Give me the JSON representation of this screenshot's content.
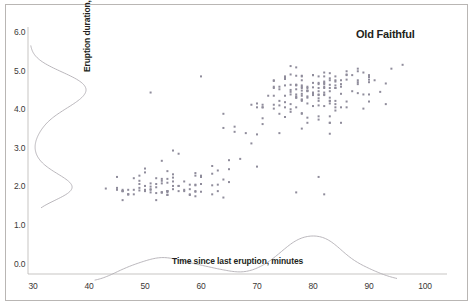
{
  "chart_data": {
    "type": "scatter",
    "title": "Old Faithful",
    "xlabel": "Time since last eruption, minutes",
    "ylabel": "Eruption duration, minutes",
    "xlim": [
      30,
      100
    ],
    "ylim": [
      0.0,
      6.0
    ],
    "xticks": [
      "30",
      "40",
      "50",
      "60",
      "70",
      "80",
      "90",
      "100"
    ],
    "xtick_values": [
      30,
      40,
      50,
      60,
      70,
      80,
      90,
      100
    ],
    "yticks": [
      "0.0",
      "1.0",
      "2.0",
      "3.0",
      "4.0",
      "5.0",
      "6.0"
    ],
    "ytick_values": [
      0,
      1,
      2,
      3,
      4,
      5,
      6
    ],
    "grid": false,
    "legend": null,
    "marker": {
      "shape": "square",
      "size_px": 2,
      "color": "#8f8c9b"
    },
    "axis_color": "#b9b6b4",
    "text_color": "#231f20",
    "background": "#ffffff",
    "x": [
      79,
      54,
      74,
      62,
      85,
      55,
      88,
      85,
      51,
      85,
      54,
      84,
      78,
      47,
      83,
      52,
      62,
      84,
      52,
      79,
      51,
      47,
      78,
      69,
      74,
      83,
      55,
      76,
      78,
      79,
      73,
      77,
      66,
      80,
      74,
      52,
      48,
      80,
      59,
      90,
      80,
      58,
      84,
      58,
      73,
      83,
      64,
      53,
      82,
      59,
      75,
      90,
      54,
      80,
      54,
      83,
      71,
      64,
      77,
      81,
      59,
      84,
      48,
      82,
      60,
      92,
      78,
      78,
      65,
      73,
      82,
      56,
      79,
      71,
      62,
      76,
      60,
      78,
      76,
      83,
      75,
      82,
      70,
      65,
      73,
      88,
      76,
      80,
      48,
      86,
      60,
      90,
      50,
      78,
      63,
      72,
      84,
      75,
      51,
      82,
      62,
      88,
      49,
      83,
      81,
      47,
      84,
      52,
      86,
      81,
      75,
      59,
      89,
      79,
      59,
      81,
      50,
      85,
      59,
      87,
      53,
      69,
      77,
      56,
      88,
      81,
      45,
      82,
      55,
      90,
      45,
      83,
      56,
      89,
      46,
      82,
      51,
      86,
      53,
      79,
      81,
      60,
      82,
      77,
      76,
      59,
      80,
      49,
      96,
      53,
      77,
      77,
      65,
      81,
      71,
      70,
      81,
      93,
      53,
      89,
      45,
      86,
      58,
      78,
      66,
      76,
      63,
      88,
      52,
      93,
      49,
      57,
      77,
      68,
      81,
      81,
      73,
      50,
      85,
      74,
      55,
      77,
      83,
      83,
      51,
      78,
      84,
      46,
      83,
      55,
      81,
      57,
      76,
      84,
      77,
      81,
      87,
      77,
      51,
      78,
      60,
      82,
      91,
      53,
      78,
      46,
      77,
      84,
      49,
      83,
      71,
      80,
      49,
      75,
      64,
      76,
      53,
      94,
      55,
      76,
      50,
      82,
      54,
      75,
      78,
      79,
      78,
      78,
      70,
      79,
      70,
      54,
      86,
      50,
      90,
      54,
      54,
      77,
      79,
      64,
      75,
      47,
      86,
      63,
      85,
      82,
      57,
      82,
      67,
      74,
      54,
      83,
      73,
      73,
      88,
      80,
      71,
      83,
      56,
      79,
      78,
      84,
      58,
      83,
      43,
      60,
      75,
      81,
      46,
      90,
      46,
      74
    ],
    "y": [
      3.6,
      1.8,
      3.333,
      2.283,
      4.533,
      2.883,
      4.7,
      3.6,
      1.95,
      4.35,
      1.833,
      3.917,
      4.2,
      1.75,
      4.7,
      2.167,
      1.75,
      4.8,
      1.6,
      4.25,
      1.8,
      1.75,
      3.45,
      3.067,
      4.533,
      3.6,
      1.967,
      4.083,
      3.85,
      4.433,
      4.3,
      4.467,
      3.367,
      4.033,
      3.833,
      2.017,
      1.867,
      4.833,
      1.833,
      4.783,
      4.35,
      1.883,
      4.567,
      1.75,
      4.533,
      3.317,
      3.833,
      2.1,
      4.633,
      2.0,
      4.8,
      4.716,
      1.833,
      4.833,
      1.733,
      4.883,
      3.717,
      1.667,
      4.567,
      4.317,
      2.233,
      4.5,
      1.75,
      4.8,
      1.817,
      4.4,
      4.167,
      4.7,
      2.067,
      4.7,
      4.033,
      1.967,
      4.5,
      4.0,
      1.983,
      5.067,
      2.017,
      4.567,
      3.883,
      3.6,
      4.133,
      4.333,
      4.1,
      2.633,
      4.067,
      4.933,
      3.95,
      4.517,
      2.167,
      4.0,
      2.2,
      4.333,
      1.867,
      4.817,
      1.833,
      4.3,
      4.667,
      3.75,
      1.867,
      4.9,
      2.483,
      4.367,
      2.1,
      4.5,
      4.05,
      1.867,
      4.7,
      1.783,
      4.85,
      3.683,
      4.733,
      2.3,
      4.9,
      4.417,
      1.7,
      4.633,
      2.317,
      4.6,
      1.817,
      4.417,
      2.617,
      4.067,
      4.25,
      1.967,
      4.6,
      3.767,
      1.917,
      4.5,
      2.267,
      4.65,
      1.867,
      4.167,
      2.8,
      4.333,
      1.833,
      4.383,
      1.883,
      4.933,
      2.033,
      3.733,
      4.233,
      2.233,
      4.533,
      4.817,
      4.333,
      1.983,
      4.633,
      2.017,
      5.1,
      1.8,
      5.033,
      4.0,
      2.4,
      4.6,
      3.567,
      4.0,
      4.5,
      4.083,
      1.8,
      3.967,
      2.2,
      4.15,
      2.0,
      3.833,
      3.5,
      4.583,
      2.367,
      5.0,
      1.933,
      4.617,
      1.917,
      2.083,
      4.583,
      3.333,
      4.167,
      4.333,
      4.5,
      2.417,
      4.0,
      4.167,
      1.883,
      4.583,
      4.25,
      3.767,
      2.033,
      4.433,
      4.083,
      1.833,
      4.417,
      2.183,
      4.8,
      1.833,
      4.4,
      4.167,
      4.333,
      2.2,
      4.833,
      1.8,
      4.383,
      4.2,
      4.8,
      1.75,
      4.7,
      2.15,
      4.8,
      1.6,
      4.25,
      4.5,
      2.233,
      4.1,
      4.067,
      4.317,
      1.85,
      4.0,
      2.133,
      4.45,
      1.8,
      5.0,
      2.083,
      4.85,
      1.833,
      4.6,
      2.35,
      4.567,
      4.35,
      4.533,
      4.533,
      4.3,
      3.3,
      4.283,
      2.467,
      1.733,
      4.717,
      1.967,
      4.15,
      2.05,
      2.15,
      4.283,
      4.1,
      3.467,
      4.3,
      1.75,
      4.833,
      2.0,
      4.7,
      4.317,
      1.867,
      4.667,
      2.667,
      4.05,
      1.833,
      4.583,
      4.683,
      3.967,
      4.65,
      4.383,
      4.0,
      4.167,
      1.833,
      4.433,
      4.5,
      4.0,
      1.733,
      4.75,
      1.9,
      2.2,
      4.783,
      4.417,
      1.867,
      4.833,
      1.833,
      4.467
    ]
  },
  "ytick_top_px": [
    27,
    66,
    104,
    143,
    181,
    220,
    259
  ],
  "xtick_left_px": [
    33,
    89,
    145,
    201,
    257,
    313,
    369,
    425
  ]
}
